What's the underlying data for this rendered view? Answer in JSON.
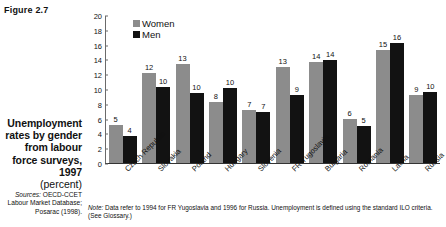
{
  "figure_label": "Figure 2.7",
  "caption": {
    "title": "Unemployment rates by gender from labour force surveys, 1997",
    "unit": "(percent)",
    "sources_prefix": "Sources:",
    "sources_text": "OECD-CCET Labour Market Database; Posarac (1998)."
  },
  "note": {
    "prefix": "Note:",
    "text": "Data refer to 1994 for FR Yugoslavia and 1996 for Russia. Unemployment is defined using the standard ILO criteria. (See Glossary.)"
  },
  "colors": {
    "women": "#8c8c8c",
    "men": "#121212",
    "axis": "#333333"
  },
  "chart_data": {
    "type": "bar",
    "title": "Unemployment rates by gender from labour force surveys, 1997",
    "xlabel": "",
    "ylabel": "",
    "ylim": [
      0,
      20
    ],
    "yticks": [
      0,
      2,
      4,
      6,
      8,
      10,
      12,
      14,
      16,
      18,
      20
    ],
    "grid": false,
    "legend_position": "top-left",
    "categories": [
      "Czech Republic",
      "Slovakia",
      "Poland",
      "Hungary",
      "Slovenia",
      "FR Yugoslavia",
      "Bulgaria",
      "Romania",
      "Latvia",
      "Russia"
    ],
    "series": [
      {
        "name": "Women",
        "color": "#8c8c8c",
        "labels": [
          5,
          12,
          13,
          8,
          7,
          13,
          14,
          6,
          15,
          9
        ],
        "values": [
          5.2,
          12.2,
          13.5,
          8.3,
          7.2,
          13.0,
          13.7,
          6.0,
          15.4,
          9.2
        ]
      },
      {
        "name": "Men",
        "color": "#121212",
        "labels": [
          4,
          10,
          10,
          10,
          7,
          9,
          14,
          5,
          16,
          10
        ],
        "values": [
          3.7,
          10.4,
          9.5,
          10.2,
          7.0,
          9.2,
          14.0,
          5.1,
          16.3,
          9.7
        ]
      }
    ]
  }
}
